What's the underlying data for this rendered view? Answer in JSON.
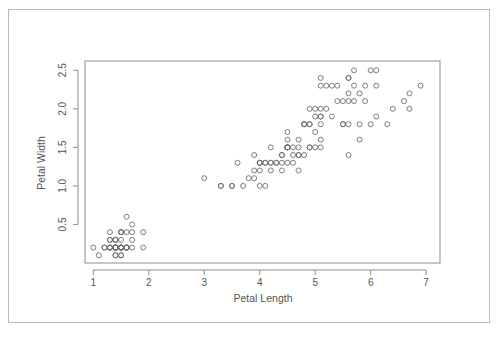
{
  "figure": {
    "title": "",
    "background_color": "#ffffff",
    "border_color": "#b9b9b9",
    "axis_color": "#8d8d8d",
    "point_color": "#6e6e6e",
    "text_color": "#555555"
  },
  "chart_data": {
    "type": "scatter",
    "title": "",
    "subtitle": "",
    "xlabel": "Petal Length",
    "ylabel": "Petal Width",
    "xlim": [
      0.85,
      7.25
    ],
    "ylim": [
      0.0,
      2.62
    ],
    "xticks": [
      1,
      2,
      3,
      4,
      5,
      6,
      7
    ],
    "xticklabels": [
      "1",
      "2",
      "3",
      "4",
      "5",
      "6",
      "7"
    ],
    "yticks": [
      0.5,
      1.0,
      1.5,
      2.0,
      2.5
    ],
    "yticklabels": [
      "0.5",
      "1.0",
      "1.5",
      "2.0",
      "2.5"
    ],
    "grid": false,
    "legend": null,
    "legend_position": "none",
    "marker": "open-circle",
    "marker_size_px": 5,
    "n_points": 150,
    "x": [
      1.4,
      1.4,
      1.3,
      1.5,
      1.4,
      1.7,
      1.4,
      1.5,
      1.4,
      1.5,
      1.5,
      1.6,
      1.4,
      1.1,
      1.2,
      1.5,
      1.3,
      1.4,
      1.7,
      1.5,
      1.7,
      1.5,
      1.0,
      1.7,
      1.9,
      1.6,
      1.6,
      1.5,
      1.4,
      1.6,
      1.6,
      1.5,
      1.5,
      1.4,
      1.5,
      1.2,
      1.3,
      1.4,
      1.3,
      1.5,
      1.3,
      1.3,
      1.3,
      1.6,
      1.9,
      1.4,
      1.6,
      1.4,
      1.5,
      1.4,
      4.7,
      4.5,
      4.9,
      4.0,
      4.6,
      4.5,
      4.7,
      3.3,
      4.6,
      3.9,
      3.5,
      4.2,
      4.0,
      4.7,
      3.6,
      4.4,
      4.5,
      4.1,
      4.5,
      3.9,
      4.8,
      4.0,
      4.9,
      4.7,
      4.3,
      4.4,
      4.8,
      5.0,
      4.5,
      3.5,
      3.8,
      3.7,
      3.9,
      5.1,
      4.5,
      4.5,
      4.7,
      4.4,
      4.1,
      4.0,
      4.4,
      4.6,
      4.0,
      3.3,
      4.2,
      4.2,
      4.2,
      4.3,
      3.0,
      4.1,
      6.0,
      5.1,
      5.9,
      5.6,
      5.8,
      6.6,
      4.5,
      6.3,
      5.8,
      6.1,
      5.1,
      5.3,
      5.5,
      5.0,
      5.1,
      5.3,
      5.5,
      6.7,
      6.9,
      5.0,
      5.7,
      4.9,
      6.7,
      4.9,
      5.7,
      6.0,
      4.8,
      4.9,
      5.6,
      5.8,
      6.1,
      6.4,
      5.6,
      5.1,
      5.6,
      6.1,
      5.6,
      5.5,
      4.8,
      5.4,
      5.6,
      5.1,
      5.1,
      5.9,
      5.7,
      5.2,
      5.0,
      5.2,
      5.4,
      5.1
    ],
    "y": [
      0.2,
      0.2,
      0.2,
      0.2,
      0.2,
      0.4,
      0.3,
      0.2,
      0.2,
      0.1,
      0.2,
      0.2,
      0.1,
      0.1,
      0.2,
      0.4,
      0.4,
      0.3,
      0.3,
      0.3,
      0.2,
      0.4,
      0.2,
      0.5,
      0.2,
      0.2,
      0.4,
      0.2,
      0.2,
      0.2,
      0.2,
      0.4,
      0.1,
      0.2,
      0.2,
      0.2,
      0.2,
      0.1,
      0.2,
      0.2,
      0.3,
      0.3,
      0.2,
      0.6,
      0.4,
      0.3,
      0.2,
      0.2,
      0.2,
      0.2,
      1.4,
      1.5,
      1.5,
      1.3,
      1.5,
      1.3,
      1.6,
      1.0,
      1.3,
      1.4,
      1.0,
      1.5,
      1.0,
      1.4,
      1.3,
      1.4,
      1.5,
      1.0,
      1.5,
      1.1,
      1.8,
      1.3,
      1.5,
      1.2,
      1.3,
      1.4,
      1.4,
      1.7,
      1.5,
      1.0,
      1.1,
      1.0,
      1.2,
      1.6,
      1.5,
      1.6,
      1.5,
      1.3,
      1.3,
      1.3,
      1.2,
      1.4,
      1.2,
      1.0,
      1.3,
      1.2,
      1.3,
      1.3,
      1.1,
      1.3,
      2.5,
      1.9,
      2.1,
      1.8,
      2.2,
      2.1,
      1.7,
      1.8,
      1.8,
      2.5,
      2.0,
      1.9,
      2.1,
      2.0,
      2.4,
      2.3,
      1.8,
      2.2,
      2.3,
      1.5,
      2.3,
      2.0,
      2.0,
      1.8,
      2.1,
      1.8,
      1.8,
      1.8,
      2.1,
      1.6,
      1.9,
      2.0,
      2.2,
      1.5,
      1.4,
      2.3,
      2.4,
      1.8,
      1.8,
      2.1,
      2.4,
      2.3,
      1.9,
      2.3,
      2.5,
      2.3,
      1.9,
      2.0,
      2.3,
      1.8
    ]
  }
}
